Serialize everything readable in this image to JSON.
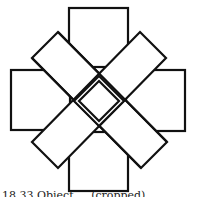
{
  "figure": {
    "stroke_color": "#111111",
    "fill_color": "#ffffff",
    "shapes": {
      "squares": [
        {
          "name": "top",
          "x": 69,
          "y": 8,
          "w": 59,
          "h": 59
        },
        {
          "name": "left",
          "x": 11,
          "y": 70,
          "w": 59,
          "h": 60
        },
        {
          "name": "right",
          "x": 126,
          "y": 70,
          "w": 59,
          "h": 61
        },
        {
          "name": "bottom",
          "x": 69,
          "y": 132,
          "w": 59,
          "h": 59
        }
      ],
      "diagonal_bars": [
        {
          "name": "tl-br",
          "points": "58,32 167,142 141,168 32,58"
        },
        {
          "name": "tr-bl",
          "points": "140,32 166,58 58,168 32,142"
        }
      ],
      "center_diamond_outer": "99,76 124,101 99,126 74,101",
      "center_diamond_inner": "99,81 119,101 99,121 79,101"
    }
  },
  "caption": {
    "text": "18.33 Obiect ... (cropped)"
  }
}
